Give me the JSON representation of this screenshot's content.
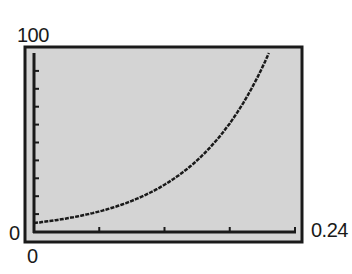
{
  "window": {
    "xmin_label": "0",
    "xmax_label": "0.24",
    "ymin_label": "0",
    "ymax_label": "100"
  },
  "colors": {
    "screen_bg": "#d4d4d4",
    "ink": "#1a1a1a",
    "page_bg": "#ffffff"
  },
  "chart_data": {
    "type": "line",
    "title": "",
    "xlabel": "",
    "ylabel": "",
    "xlim": [
      0,
      0.24
    ],
    "ylim": [
      0,
      100
    ],
    "x_ticks": [
      0.06,
      0.12,
      0.18,
      0.24
    ],
    "y_ticks": [
      10,
      20,
      30,
      40,
      50,
      60,
      70,
      80,
      90
    ],
    "grid": false,
    "legend": "none",
    "series": [
      {
        "name": "curve",
        "x": [
          0,
          0.02,
          0.04,
          0.06,
          0.08,
          0.1,
          0.12,
          0.14,
          0.16,
          0.18,
          0.2,
          0.216
        ],
        "y": [
          5,
          6.6,
          8.7,
          11.5,
          15.2,
          20.0,
          26.4,
          34.9,
          46.0,
          60.7,
          80.2,
          100
        ]
      }
    ]
  }
}
